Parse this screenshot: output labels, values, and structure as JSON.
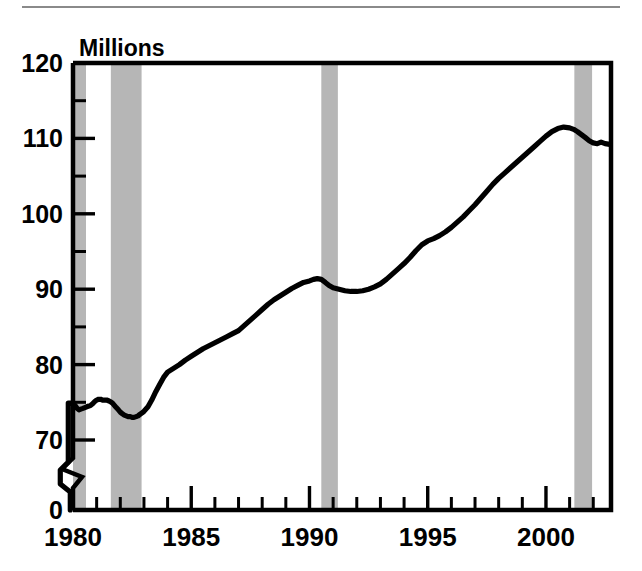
{
  "figure": {
    "title_label": "Millions",
    "has_top_rule": true,
    "background_color": "#ffffff",
    "line_color": "#000000",
    "band_color": "#b6b6b6"
  },
  "chart_data": {
    "type": "line",
    "title": "",
    "subtitle": "",
    "xlabel": "",
    "ylabel": "Millions",
    "units": "Millions",
    "grid": false,
    "legend": "none",
    "xlim": [
      1979.9,
      2002.75
    ],
    "ylim": [
      70,
      120
    ],
    "y_axis_break": true,
    "y_axis_break_between": [
      0,
      70
    ],
    "xticks": [
      1980,
      1985,
      1990,
      1995,
      2000
    ],
    "xticklabels": [
      "1980",
      "1985",
      "1990",
      "1995",
      "2000"
    ],
    "x_minor_ticks": [
      1981,
      1982,
      1983,
      1984,
      1986,
      1987,
      1988,
      1989,
      1991,
      1992,
      1993,
      1994,
      1996,
      1997,
      1998,
      1999,
      2001,
      2002
    ],
    "yticks": [
      0,
      70,
      80,
      90,
      100,
      110,
      120
    ],
    "yticklabels": [
      "0",
      "70",
      "80",
      "90",
      "100",
      "110",
      "120"
    ],
    "y_minor_ticks": [
      75,
      85,
      95,
      105,
      115
    ],
    "shaded_regions": [
      {
        "name": "recession-1980",
        "start": 1980.0,
        "end": 1980.55
      },
      {
        "name": "recession-1981-1982",
        "start": 1981.6,
        "end": 1982.9
      },
      {
        "name": "recession-1990-1991",
        "start": 1990.5,
        "end": 1991.2
      },
      {
        "name": "recession-2001",
        "start": 2001.2,
        "end": 2001.95
      }
    ],
    "series": [
      {
        "name": "Employment",
        "x": [
          1980.0,
          1980.08,
          1980.17,
          1980.25,
          1980.33,
          1980.42,
          1980.5,
          1980.58,
          1980.67,
          1980.75,
          1980.83,
          1980.92,
          1981.0,
          1981.08,
          1981.17,
          1981.25,
          1981.33,
          1981.42,
          1981.5,
          1981.58,
          1981.67,
          1981.75,
          1981.83,
          1981.92,
          1982.0,
          1982.08,
          1982.17,
          1982.25,
          1982.33,
          1982.42,
          1982.5,
          1982.58,
          1982.67,
          1982.75,
          1982.83,
          1982.92,
          1983.0,
          1983.17,
          1983.33,
          1983.5,
          1983.67,
          1983.83,
          1984.0,
          1984.25,
          1984.5,
          1984.75,
          1985.0,
          1985.25,
          1985.5,
          1985.75,
          1986.0,
          1986.25,
          1986.5,
          1986.75,
          1987.0,
          1987.25,
          1987.5,
          1987.75,
          1988.0,
          1988.25,
          1988.5,
          1988.75,
          1989.0,
          1989.25,
          1989.5,
          1989.75,
          1990.0,
          1990.17,
          1990.33,
          1990.5,
          1990.67,
          1990.83,
          1991.0,
          1991.25,
          1991.5,
          1991.75,
          1992.0,
          1992.25,
          1992.5,
          1992.75,
          1993.0,
          1993.25,
          1993.5,
          1993.75,
          1994.0,
          1994.25,
          1994.5,
          1994.75,
          1995.0,
          1995.25,
          1995.5,
          1995.75,
          1996.0,
          1996.25,
          1996.5,
          1996.75,
          1997.0,
          1997.25,
          1997.5,
          1997.75,
          1998.0,
          1998.25,
          1998.5,
          1998.75,
          1999.0,
          1999.25,
          1999.5,
          1999.75,
          2000.0,
          2000.25,
          2000.5,
          2000.75,
          2001.0,
          2001.17,
          2001.33,
          2001.5,
          2001.67,
          2001.83,
          2002.0,
          2002.17,
          2002.33,
          2002.5,
          2002.7
        ],
        "y": [
          74.9,
          74.6,
          74.2,
          74.0,
          74.1,
          74.2,
          74.3,
          74.4,
          74.5,
          74.6,
          74.8,
          75.1,
          75.3,
          75.4,
          75.4,
          75.3,
          75.3,
          75.3,
          75.2,
          75.1,
          74.9,
          74.6,
          74.3,
          74.0,
          73.7,
          73.5,
          73.3,
          73.2,
          73.1,
          73.1,
          73.0,
          73.0,
          73.1,
          73.2,
          73.4,
          73.6,
          73.8,
          74.4,
          75.3,
          76.4,
          77.4,
          78.3,
          79.0,
          79.5,
          80.0,
          80.6,
          81.1,
          81.6,
          82.1,
          82.5,
          82.9,
          83.3,
          83.7,
          84.1,
          84.5,
          85.2,
          85.9,
          86.6,
          87.3,
          88.0,
          88.6,
          89.1,
          89.6,
          90.1,
          90.5,
          90.9,
          91.1,
          91.3,
          91.4,
          91.3,
          90.9,
          90.5,
          90.2,
          90.0,
          89.8,
          89.7,
          89.7,
          89.8,
          90.0,
          90.3,
          90.7,
          91.3,
          92.0,
          92.7,
          93.4,
          94.2,
          95.1,
          95.9,
          96.4,
          96.7,
          97.1,
          97.6,
          98.2,
          98.9,
          99.6,
          100.4,
          101.2,
          102.1,
          103.0,
          103.9,
          104.7,
          105.4,
          106.1,
          106.8,
          107.5,
          108.2,
          108.9,
          109.6,
          110.3,
          110.9,
          111.3,
          111.5,
          111.4,
          111.2,
          110.9,
          110.5,
          110.1,
          109.7,
          109.4,
          109.3,
          109.5,
          109.3,
          109.2
        ]
      }
    ],
    "pre_break_segment": {
      "name": "axis-break-stub",
      "description": "short stub of the series below the y-axis break near 1980",
      "x": [
        1979.97,
        1980.0
      ],
      "y_display": [
        66.0,
        74.9
      ]
    }
  }
}
